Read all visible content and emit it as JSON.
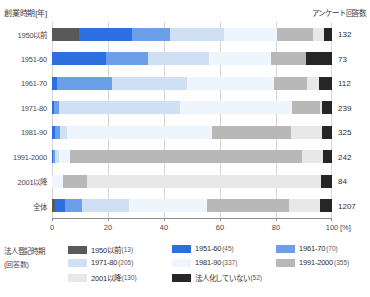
{
  "header": {
    "left_axis_title": "創業時期[年]",
    "right_title": "アンケート回答数"
  },
  "legend": {
    "title": "法人登記時期",
    "subtitle": "(回答数)",
    "items": [
      {
        "label": "1950以前",
        "count": "(13)",
        "color": "#595959",
        "col": 0,
        "row": 0
      },
      {
        "label": "1951-60",
        "count": "(45)",
        "color": "#2d6fe0",
        "col": 1,
        "row": 0
      },
      {
        "label": "1961-70",
        "count": "(70)",
        "color": "#6d9fe8",
        "col": 2,
        "row": 0
      },
      {
        "label": "1971-80",
        "count": "(205)",
        "color": "#cfe0f5",
        "col": 0,
        "row": 1
      },
      {
        "label": "1981-90",
        "count": "(337)",
        "color": "#eef5fc",
        "col": 1,
        "row": 1
      },
      {
        "label": "1991-2000",
        "count": "(355)",
        "color": "#b8b8b8",
        "col": 2,
        "row": 1
      },
      {
        "label": "2001以降",
        "count": "(130)",
        "color": "#e8e8e8",
        "col": 0,
        "row": 2
      },
      {
        "label": "法人化していない",
        "count": "(52)",
        "color": "#262626",
        "col": 1,
        "row": 2
      }
    ]
  },
  "chart_data": {
    "type": "bar",
    "subtype": "stacked-horizontal-100",
    "title": "",
    "xlabel": "100 [%]",
    "ylabel": "創業時期[年]",
    "xlim": [
      0,
      100
    ],
    "xticks": [
      0,
      20,
      40,
      60,
      80,
      100
    ],
    "xtick_labels": [
      "0",
      "20",
      "40",
      "60",
      "80",
      "100"
    ],
    "x_unit": "[%]",
    "grid": true,
    "legend_position": "bottom",
    "categories": [
      "1950以前",
      "1951-60",
      "1961-70",
      "1971-80",
      "1981-90",
      "1991-2000",
      "2001以降",
      "全体"
    ],
    "response_counts": [
      132,
      73,
      112,
      239,
      325,
      242,
      84,
      1207
    ],
    "series": [
      {
        "name": "1950以前",
        "color": "#595959",
        "values": [
          9.8,
          0.0,
          0.0,
          0.0,
          0.0,
          0.0,
          0.0,
          1.1
        ]
      },
      {
        "name": "1951-60",
        "color": "#2d6fe0",
        "values": [
          18.9,
          19.2,
          1.8,
          0.8,
          1.2,
          0.4,
          0.0,
          3.7
        ]
      },
      {
        "name": "1961-70",
        "color": "#6d9fe8",
        "values": [
          13.6,
          15.1,
          19.6,
          1.7,
          1.5,
          0.8,
          0.0,
          5.8
        ]
      },
      {
        "name": "1971-80",
        "color": "#cfe0f5",
        "values": [
          19.0,
          21.9,
          26.8,
          43.1,
          2.5,
          1.2,
          0.0,
          16.9
        ]
      },
      {
        "name": "1981-90",
        "color": "#eef5fc",
        "values": [
          19.0,
          22.0,
          31.2,
          40.0,
          52.0,
          4.0,
          4.0,
          27.9
        ]
      },
      {
        "name": "1991-2000",
        "color": "#b8b8b8",
        "values": [
          12.9,
          12.6,
          11.6,
          10.0,
          28.0,
          83.0,
          8.5,
          29.4
        ]
      },
      {
        "name": "2001以降",
        "color": "#e8e8e8",
        "values": [
          3.8,
          0.0,
          4.5,
          0.8,
          11.1,
          7.4,
          83.5,
          10.8
        ]
      },
      {
        "name": "法人化していない",
        "color": "#262626",
        "values": [
          3.0,
          9.2,
          4.5,
          3.6,
          3.7,
          3.2,
          4.0,
          4.4
        ]
      }
    ]
  }
}
